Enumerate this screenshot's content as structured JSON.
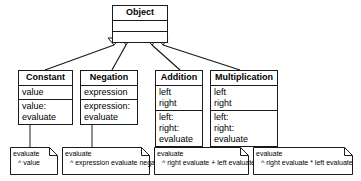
{
  "diagram": {
    "style": {
      "line_color": "#1a1a1a",
      "fill_color": "#ffffff",
      "text_color": "#000000"
    },
    "root": {
      "name": "Object",
      "attributes": [],
      "operations": []
    },
    "classes": [
      {
        "name": "Constant",
        "attributes": [
          "value"
        ],
        "operations": [
          "value:",
          "evaluate"
        ]
      },
      {
        "name": "Negation",
        "attributes": [
          "expression"
        ],
        "operations": [
          "expression:",
          "evaluate"
        ]
      },
      {
        "name": "Addition",
        "attributes": [
          "left",
          "right"
        ],
        "operations": [
          "left:",
          "right:",
          "evaluate"
        ]
      },
      {
        "name": "Multiplication",
        "attributes": [
          "left",
          "right"
        ],
        "operations": [
          "left:",
          "right:",
          "evaluate"
        ]
      }
    ],
    "notes": [
      {
        "header": "evaluate",
        "body": "^ value",
        "attached_to": "Constant"
      },
      {
        "header": "evaluate",
        "body": "^ expression evaluate negated",
        "attached_to": "Negation"
      },
      {
        "header": "evaluate",
        "body": "^ right evaluate + left evaluate",
        "attached_to": "Addition"
      },
      {
        "header": "evaluate",
        "body": "^ right evaluate * left evaluate",
        "attached_to": "Multiplication"
      }
    ],
    "relationships": [
      {
        "type": "generalization",
        "from": "Constant",
        "to": "Object"
      },
      {
        "type": "generalization",
        "from": "Negation",
        "to": "Object"
      },
      {
        "type": "generalization",
        "from": "Addition",
        "to": "Object"
      },
      {
        "type": "generalization",
        "from": "Multiplication",
        "to": "Object"
      }
    ]
  }
}
